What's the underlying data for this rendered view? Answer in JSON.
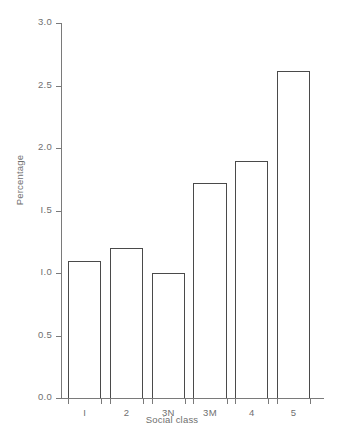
{
  "chart_data": {
    "type": "bar",
    "title": "",
    "subtitle": "",
    "xlabel": "Social class",
    "ylabel": "Percentage",
    "categories": [
      "1",
      "2",
      "3N",
      "3M",
      "4",
      "5"
    ],
    "category_labels_rendered": [
      "I",
      "2",
      "3N",
      "3M",
      "4",
      "5"
    ],
    "values": [
      1.1,
      1.2,
      1.0,
      1.72,
      1.9,
      2.62
    ],
    "ylim": [
      0.0,
      3.0
    ],
    "ytick_values": [
      0.0,
      0.5,
      1.0,
      1.5,
      2.0,
      2.5,
      3.0
    ],
    "ytick_labels": [
      "0.0",
      "0.5",
      "I.0",
      "I.5",
      "2.0",
      "2.5",
      "3.0"
    ],
    "grid": false,
    "legend": null,
    "annotations": [],
    "bar_fill": "#ffffff",
    "bar_edge_color": "#4a4a4a",
    "axis_color": "#7a7a7a",
    "text_color": "#6f6f6f",
    "background": "#ffffff"
  }
}
